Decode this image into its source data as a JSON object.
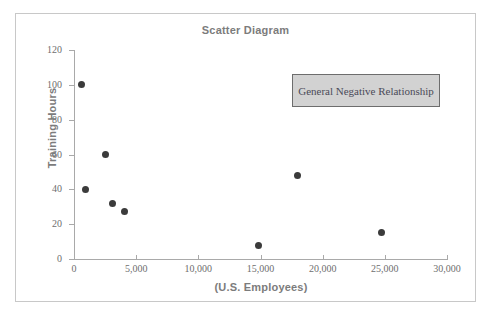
{
  "figure": {
    "title": "Scatter Diagram",
    "frame_color": "#c8c8c8",
    "background": "#ffffff"
  },
  "annotation": {
    "text": "General Negative Relationship",
    "fill_color": "#d2d2d2",
    "border_color": "#6d6d6d"
  },
  "chart_data": {
    "type": "scatter",
    "title": "Scatter Diagram",
    "xlabel": "(U.S. Employees)",
    "ylabel": "Training Hours",
    "xlim": [
      0,
      30000
    ],
    "ylim": [
      0,
      120
    ],
    "xticks": [
      0,
      5000,
      10000,
      15000,
      20000,
      25000,
      30000
    ],
    "xticklabels": [
      "0",
      "5,000",
      "10,000",
      "15,000",
      "20,000",
      "25,000",
      "30,000"
    ],
    "yticks": [
      0,
      20,
      40,
      60,
      80,
      100,
      120
    ],
    "yticklabels": [
      "0",
      "20",
      "40",
      "60",
      "80",
      "100",
      "120"
    ],
    "grid": false,
    "legend": false,
    "marker_color": "#3b3b3b",
    "marker_size": 7,
    "annotations": [
      {
        "text": "General Negative Relationship",
        "x": 21500,
        "y": 102
      }
    ],
    "points": [
      {
        "x": 600,
        "y": 100
      },
      {
        "x": 900,
        "y": 40
      },
      {
        "x": 2500,
        "y": 60
      },
      {
        "x": 3100,
        "y": 32
      },
      {
        "x": 4100,
        "y": 27
      },
      {
        "x": 14800,
        "y": 8
      },
      {
        "x": 18000,
        "y": 48
      },
      {
        "x": 24700,
        "y": 15
      }
    ]
  }
}
